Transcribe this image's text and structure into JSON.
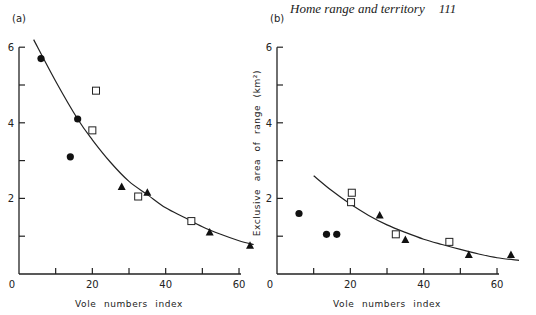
{
  "header": {
    "running_title": "Home range and territory",
    "page_number": "111"
  },
  "chart_data": [
    {
      "type": "scatter",
      "panel": "(a)",
      "title": "",
      "xlabel": "Vole numbers index",
      "ylabel": "",
      "xlim": [
        0,
        63
      ],
      "ylim": [
        0,
        6
      ],
      "x_ticks": [
        0,
        10,
        20,
        30,
        40,
        50,
        60
      ],
      "x_tick_labels": [
        "0",
        "",
        "20",
        "",
        "40",
        "",
        "60"
      ],
      "y_ticks": [
        1,
        2,
        3,
        4,
        5,
        6
      ],
      "y_tick_labels": [
        "",
        "2",
        "",
        "4",
        "",
        "6"
      ],
      "grid": false,
      "series": [
        {
          "name": "circles",
          "marker": "filled-circle",
          "points": [
            [
              6,
              5.7
            ],
            [
              16,
              4.1
            ],
            [
              14,
              3.1
            ]
          ]
        },
        {
          "name": "squares",
          "marker": "open-square",
          "points": [
            [
              21,
              4.85
            ],
            [
              20,
              3.8
            ],
            [
              32.5,
              2.05
            ],
            [
              47,
              1.4
            ]
          ]
        },
        {
          "name": "triangles",
          "marker": "filled-triangle",
          "points": [
            [
              28,
              2.3
            ],
            [
              35,
              2.15
            ],
            [
              52,
              1.1
            ],
            [
              63,
              0.75
            ]
          ]
        }
      ],
      "fit_curve": {
        "type": "exponential-decay",
        "points": [
          [
            4,
            6.2
          ],
          [
            10,
            5.1
          ],
          [
            16,
            4.1
          ],
          [
            20,
            3.55
          ],
          [
            25,
            2.95
          ],
          [
            30,
            2.45
          ],
          [
            35,
            2.1
          ],
          [
            40,
            1.75
          ],
          [
            45,
            1.5
          ],
          [
            50,
            1.25
          ],
          [
            55,
            1.05
          ],
          [
            60,
            0.88
          ],
          [
            64,
            0.78
          ]
        ]
      }
    },
    {
      "type": "scatter",
      "panel": "(b)",
      "title": "",
      "xlabel": "Vole numbers index",
      "ylabel": "Exclusive area of range (km²)",
      "xlim": [
        0,
        63
      ],
      "ylim": [
        0,
        6
      ],
      "x_ticks": [
        0,
        10,
        20,
        30,
        40,
        50,
        60
      ],
      "x_tick_labels": [
        "0",
        "",
        "20",
        "",
        "40",
        "",
        "60"
      ],
      "y_ticks": [
        1,
        2,
        3,
        4,
        5,
        6
      ],
      "y_tick_labels": [
        "",
        "2",
        "",
        "4",
        "",
        "6"
      ],
      "grid": false,
      "series": [
        {
          "name": "circles",
          "marker": "filled-circle",
          "points": [
            [
              6,
              1.6
            ],
            [
              13.5,
              1.05
            ],
            [
              16.3,
              1.05
            ]
          ]
        },
        {
          "name": "squares",
          "marker": "open-square",
          "points": [
            [
              20.4,
              2.15
            ],
            [
              20.2,
              1.9
            ],
            [
              32.4,
              1.05
            ],
            [
              47,
              0.85
            ]
          ]
        },
        {
          "name": "triangles",
          "marker": "filled-triangle",
          "points": [
            [
              28,
              1.55
            ],
            [
              35,
              0.9
            ],
            [
              52.3,
              0.5
            ],
            [
              63.8,
              0.5
            ]
          ]
        }
      ],
      "fit_curve": {
        "type": "exponential-decay",
        "points": [
          [
            10,
            2.6
          ],
          [
            15,
            2.2
          ],
          [
            20,
            1.85
          ],
          [
            25,
            1.55
          ],
          [
            30,
            1.3
          ],
          [
            35,
            1.1
          ],
          [
            40,
            0.92
          ],
          [
            45,
            0.78
          ],
          [
            50,
            0.65
          ],
          [
            55,
            0.53
          ],
          [
            60,
            0.43
          ],
          [
            66,
            0.36
          ]
        ]
      }
    }
  ]
}
